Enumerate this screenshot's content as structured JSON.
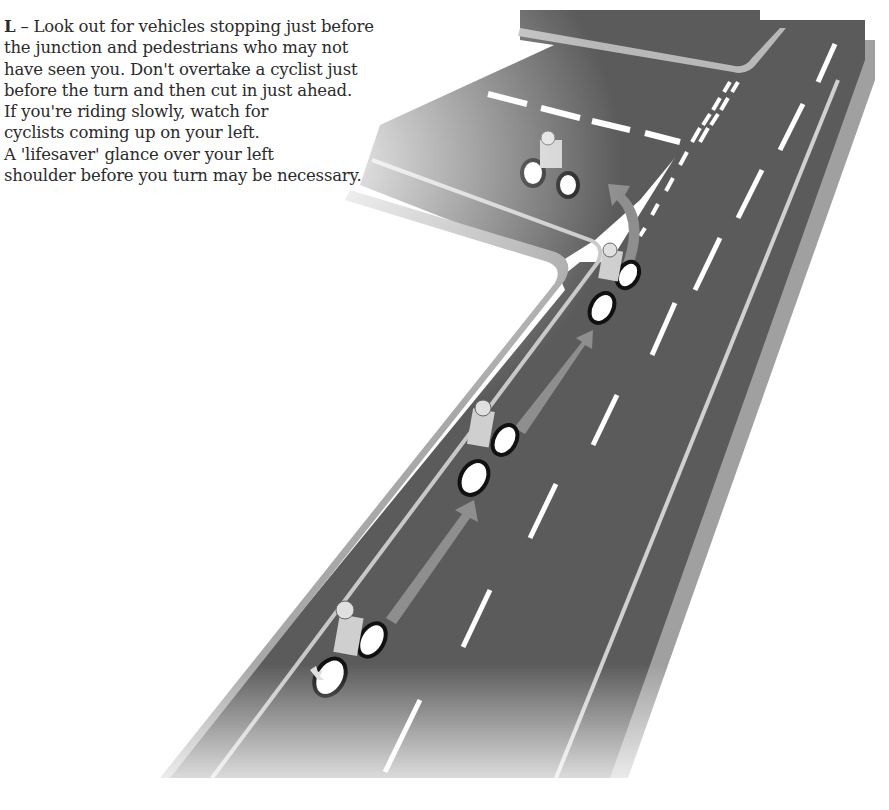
{
  "text": {
    "lead_letter": "L",
    "lines": [
      " – Look out for vehicles stopping just before",
      "the junction and pedestrians who may not",
      "have seen you. Don't overtake a cyclist just",
      "before the turn and then cut in just ahead.",
      "If you're riding slowly, watch for",
      "cyclists coming up on your left.",
      "A 'lifesaver' glance over your left",
      "shoulder before you turn may be necessary."
    ]
  },
  "illustration": {
    "subject": "motorcycle-turning-left-at-junction",
    "riders": 4,
    "colors": {
      "road": "#5a5a5a",
      "kerb": "#a8a8a8",
      "lane_marking": "#ffffff",
      "path_arrow": "#8c8c8c",
      "rider_jacket": "#c8c8c8",
      "indicator": "#e0e0e0"
    }
  }
}
